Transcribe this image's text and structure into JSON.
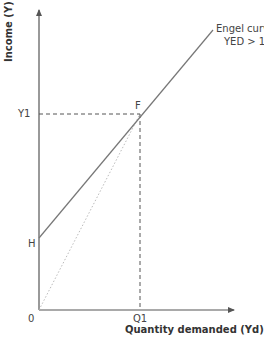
{
  "diagram": {
    "type": "engel-curve",
    "y_axis_label": "Income (Y)",
    "x_axis_label": "Quantity demanded (Yd)",
    "origin_label": "0",
    "y1_label": "Y1",
    "q1_label": "Q1",
    "h_label": "H",
    "f_label": "F",
    "curve_label_line1": "Engel curve",
    "curve_label_line2": "YED > 1",
    "colors": {
      "axis": "#555555",
      "curve": "#777777",
      "dashed": "#555555",
      "dotted": "#bbbbbb",
      "text": "#444444"
    }
  }
}
